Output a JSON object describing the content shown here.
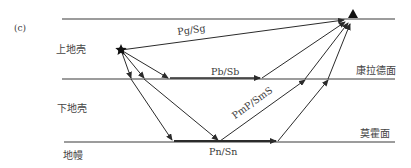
{
  "figure": {
    "panel_label": "(c)",
    "layers": {
      "upper_crust": "上地壳",
      "lower_crust": "下地壳",
      "mantle": "地幔"
    },
    "interfaces": {
      "conrad": "康拉德面",
      "moho": "莫霍面"
    },
    "rays": {
      "direct": "Pg/Sg",
      "conrad_head": "Pb/Sb",
      "moho_reflected": "PmP/SmS",
      "moho_head": "Pn/Sn"
    },
    "markers": {
      "source": "star-source-icon",
      "receiver": "triangle-station-icon"
    },
    "colors": {
      "line": "#2b2b2b",
      "text": "#3a3a3a",
      "background": "#ffffff"
    }
  }
}
